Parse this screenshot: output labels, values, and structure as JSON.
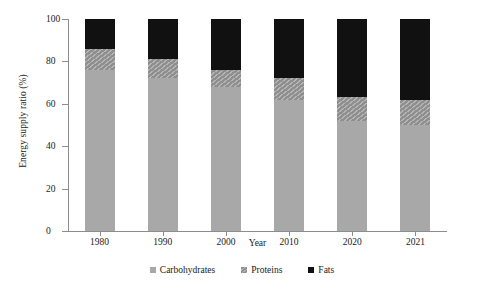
{
  "chart_data": {
    "type": "bar",
    "stacked": true,
    "title": "",
    "xlabel": "Year",
    "ylabel": "Energy supply ratio (%)",
    "categories": [
      "1980",
      "1990",
      "2000",
      "2010",
      "2020",
      "2021"
    ],
    "ylim": [
      0,
      100
    ],
    "yticks": [
      0,
      20,
      40,
      60,
      80,
      100
    ],
    "grid": false,
    "legend_position": "bottom",
    "series": [
      {
        "name": "Carbohydrates",
        "color": "#a8a8a8",
        "values": [
          76,
          72,
          68,
          62,
          52,
          50
        ]
      },
      {
        "name": "Proteins",
        "color": "#8e8e8e",
        "values": [
          10,
          9,
          8,
          10,
          11,
          12
        ]
      },
      {
        "name": "Fats",
        "color": "#111111",
        "values": [
          14,
          19,
          24,
          28,
          37,
          38
        ]
      }
    ],
    "cumulative_tops": {
      "carbohydrates": [
        76,
        72,
        68,
        62,
        52,
        50
      ],
      "proteins": [
        86,
        81,
        76,
        72,
        63,
        62
      ],
      "fats": [
        100,
        100,
        100,
        100,
        100,
        100
      ]
    }
  },
  "legend": {
    "items": [
      {
        "label": "Carbohydrates",
        "swatch": "carbohydrates-swatch"
      },
      {
        "label": "Proteins",
        "swatch": "proteins-swatch"
      },
      {
        "label": "Fats",
        "swatch": "fats-swatch"
      }
    ]
  }
}
